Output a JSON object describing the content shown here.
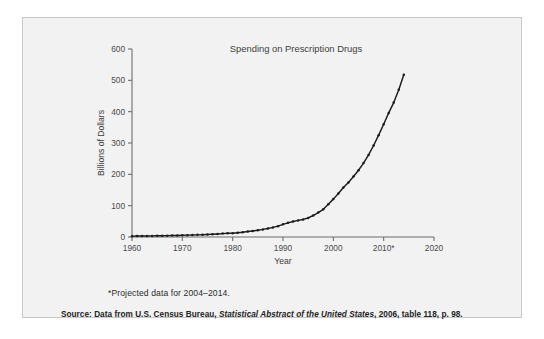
{
  "figure": {
    "background_color": "#f2f2f2",
    "border_color": "#c8c8c8",
    "page_background": "#ffffff",
    "line_color": "#1c1c1c",
    "axis_color": "#6d6d6d"
  },
  "footnote": "*Projected data for 2004–2014.",
  "source": {
    "prefix": "Source: Data from U.S. Census Bureau, ",
    "italic": "Statistical Abstract of the United States",
    "suffix": ", 2006, table 118, p. 98."
  },
  "chart_data": {
    "type": "line",
    "title": "Spending on Prescription Drugs",
    "xlabel": "Year",
    "ylabel": "Billions of Dollars",
    "xlim": [
      1960,
      2020
    ],
    "ylim": [
      0,
      600
    ],
    "xticks": [
      1960,
      1970,
      1980,
      1990,
      2000,
      2010,
      2020
    ],
    "xticklabels": [
      "1960",
      "1970",
      "1980",
      "1990",
      "2000",
      "2010*",
      "2020"
    ],
    "yticks": [
      0,
      100,
      200,
      300,
      400,
      500,
      600
    ],
    "yticklabels": [
      "0",
      "100",
      "200",
      "300",
      "400",
      "500",
      "600"
    ],
    "grid": false,
    "legend": null,
    "markers": true,
    "series": [
      {
        "name": "Prescription drug spending",
        "x": [
          1960,
          1961,
          1962,
          1963,
          1964,
          1965,
          1966,
          1967,
          1968,
          1969,
          1970,
          1971,
          1972,
          1973,
          1974,
          1975,
          1976,
          1977,
          1978,
          1979,
          1980,
          1981,
          1982,
          1983,
          1984,
          1985,
          1986,
          1987,
          1988,
          1989,
          1990,
          1991,
          1992,
          1993,
          1994,
          1995,
          1996,
          1997,
          1998,
          1999,
          2000,
          2001,
          2002,
          2003,
          2004,
          2005,
          2006,
          2007,
          2008,
          2009,
          2010,
          2011,
          2012,
          2013,
          2014
        ],
        "values": [
          2.7,
          2.9,
          3.1,
          3.3,
          3.5,
          3.7,
          4.0,
          4.3,
          4.6,
          5.0,
          5.5,
          5.9,
          6.3,
          6.8,
          7.4,
          8.1,
          8.9,
          9.8,
          10.8,
          12.0,
          12.0,
          13.7,
          15.4,
          17.3,
          19.4,
          21.8,
          24.3,
          27.2,
          30.6,
          34.6,
          40.3,
          45.2,
          49.4,
          53.0,
          56.1,
          60.8,
          68.6,
          77.9,
          88.5,
          104.4,
          120.9,
          138.6,
          157.9,
          174.2,
          193.0,
          213.0,
          236.0,
          262.0,
          292.0,
          325.0,
          360.0,
          396.0,
          429.0,
          470.0,
          518.0
        ]
      }
    ]
  }
}
